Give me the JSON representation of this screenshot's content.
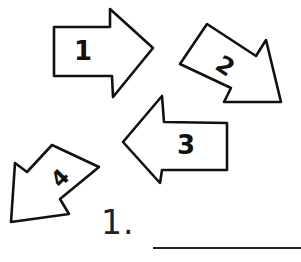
{
  "arrows": [
    {
      "label": "1",
      "direction": "right"
    },
    {
      "label": "2",
      "direction": "down-right"
    },
    {
      "label": "3",
      "direction": "left"
    },
    {
      "label": "4",
      "direction": "down-left"
    }
  ],
  "answer": {
    "label": "1.",
    "value": ""
  },
  "colors": {
    "ink": "#111111",
    "background": "#ffffff"
  }
}
